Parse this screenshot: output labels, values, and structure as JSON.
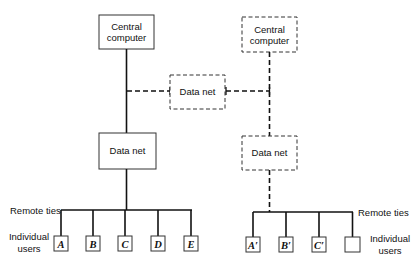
{
  "diagram": {
    "left_system": {
      "central_computer": {
        "line1": "Central",
        "line2": "computer",
        "style": "solid"
      },
      "data_net": {
        "label": "Data net",
        "style": "solid"
      },
      "remote_ties_label": "Remote ties",
      "individual_users_label": {
        "line1": "Individual",
        "line2": "users"
      },
      "users": [
        "A",
        "B",
        "C",
        "D",
        "E"
      ]
    },
    "shared_data_net": {
      "label": "Data net",
      "style": "dashed"
    },
    "right_system": {
      "central_computer": {
        "line1": "Central",
        "line2": "computer",
        "style": "dashed"
      },
      "data_net": {
        "label": "Data net",
        "style": "dashed"
      },
      "remote_ties_label": "Remote ties",
      "individual_users_label": {
        "line1": "Individual",
        "line2": "users"
      },
      "users": [
        "A′",
        "B′",
        "C′",
        ""
      ]
    }
  }
}
